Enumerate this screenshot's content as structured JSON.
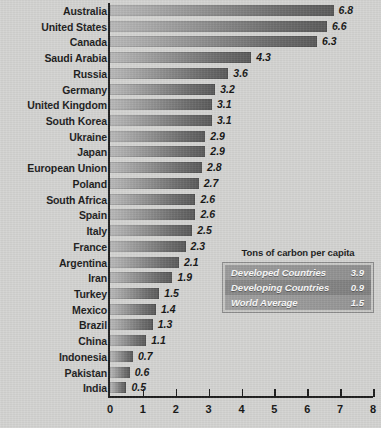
{
  "chart_data": {
    "type": "bar",
    "title": "",
    "orientation": "horizontal",
    "xlabel": "",
    "ylabel": "",
    "xlim": [
      0,
      8
    ],
    "grid": false,
    "tick_labels": [
      "0",
      "1",
      "2",
      "3",
      "4",
      "5",
      "6",
      "7",
      "8"
    ],
    "ticks": [
      0,
      1,
      2,
      3,
      4,
      5,
      6,
      7,
      8
    ],
    "categories": [
      "Australia",
      "United States",
      "Canada",
      "Saudi Arabia",
      "Russia",
      "Germany",
      "United Kingdom",
      "South Korea",
      "Ukraine",
      "Japan",
      "European Union",
      "Poland",
      "South Africa",
      "Spain",
      "Italy",
      "France",
      "Argentina",
      "Iran",
      "Turkey",
      "Mexico",
      "Brazil",
      "China",
      "Indonesia",
      "Pakistan",
      "India"
    ],
    "values": [
      6.8,
      6.6,
      6.3,
      4.3,
      3.6,
      3.2,
      3.1,
      3.1,
      2.9,
      2.9,
      2.8,
      2.7,
      2.6,
      2.6,
      2.5,
      2.3,
      2.1,
      1.9,
      1.5,
      1.4,
      1.3,
      1.1,
      0.7,
      0.6,
      0.5
    ],
    "value_labels": [
      "6.8",
      "6.6",
      "6.3",
      "4.3",
      "3.6",
      "3.2",
      "3.1",
      "3.1",
      "2.9",
      "2.9",
      "2.8",
      "2.7",
      "2.6",
      "2.6",
      "2.5",
      "2.3",
      "2.1",
      "1.9",
      "1.5",
      "1.4",
      "1.3",
      "1.1",
      "0.7",
      "0.6",
      "0.5"
    ],
    "bar_color_start": "#b9b9b9",
    "bar_color_end": "#5a5a5a",
    "background_color": "#d4d4d2",
    "axis_color": "#1d1d1d"
  },
  "legend": {
    "title": "Tons of carbon per capita",
    "position": "inner-right",
    "rows": [
      {
        "label": "Developed Countries",
        "value": "3.9"
      },
      {
        "label": "Developing Countries",
        "value": "0.9"
      },
      {
        "label": "World Average",
        "value": "1.5"
      }
    ]
  }
}
